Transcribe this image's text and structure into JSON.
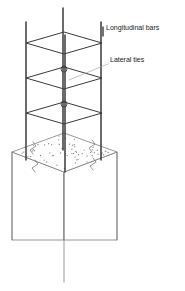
{
  "figure": {
    "kind": "isometric-engineering-detail",
    "background_color": "#ffffff",
    "line_color": "#6e6e6e",
    "bar_color": "#3a3a3a",
    "stipple_color": "#8a8a8a",
    "text_color": "#1a1a1a"
  },
  "annotations": [
    {
      "id": "longitudinal-bars",
      "label": "Longitudinal bars",
      "text_x": 106,
      "text_y": 30,
      "leader": {
        "x1": 103,
        "y1": 27,
        "x2": 103,
        "y2": 36,
        "style": "tick"
      }
    },
    {
      "id": "lateral-ties",
      "label": "Lateral ties",
      "text_x": 110,
      "text_y": 62,
      "leader": {
        "x1": 108,
        "y1": 64,
        "x2": 69,
        "y2": 80,
        "style": "line"
      }
    }
  ],
  "cage": {
    "description": "Square tie cage drawn in isometric: each lateral tie reads as a rhombus; four longitudinal bars at the rhombus corners.",
    "tie_count": 3,
    "tie_levels_y": [
      43,
      78,
      113
    ],
    "rhombus": {
      "half_width": 38,
      "half_height": 11,
      "center_x": 64
    },
    "ties": [
      {
        "index": 1,
        "center_y": 43,
        "label": "lateral-tie-top"
      },
      {
        "index": 2,
        "center_y": 78,
        "label": "lateral-tie-middle"
      },
      {
        "index": 3,
        "center_y": 113,
        "label": "lateral-tie-bottom"
      }
    ],
    "bars": [
      {
        "id": "bar-left",
        "x": 26,
        "y_top": 22,
        "y_bottom": 160,
        "role": "corner"
      },
      {
        "id": "bar-rear-center",
        "x": 63,
        "y_top": 8,
        "y_bottom": 150,
        "role": "corner-rear"
      },
      {
        "id": "bar-front-center",
        "x": 65,
        "y_top": 35,
        "y_bottom": 172,
        "role": "corner-front"
      },
      {
        "id": "bar-right",
        "x": 101,
        "y_top": 22,
        "y_bottom": 160,
        "role": "corner"
      }
    ],
    "tie_hooks": [
      {
        "x": 64,
        "y": 69,
        "r": 3
      },
      {
        "x": 64,
        "y": 104,
        "r": 3
      }
    ]
  },
  "concrete_block": {
    "description": "Column below shown cut: stippled isometric top face with break-line symbols, prism body continuing downward.",
    "top_face": {
      "top_vertex": {
        "x": 64,
        "y": 133
      },
      "right_vertex": {
        "x": 117,
        "y": 152
      },
      "bottom_vertex": {
        "x": 64,
        "y": 172
      },
      "left_vertex": {
        "x": 12,
        "y": 152
      }
    },
    "body": {
      "left_edge": {
        "x": 12,
        "y_top": 152,
        "y_bottom": 240
      },
      "right_edge": {
        "x": 117,
        "y_top": 152,
        "y_bottom": 240
      },
      "center_edge": {
        "x": 64,
        "y_top": 172,
        "y_bottom": 282
      }
    },
    "break_lines": [
      {
        "id": "break-left",
        "x": 33,
        "y": 148
      },
      {
        "id": "break-right",
        "x": 92,
        "y": 146
      },
      {
        "id": "break-front-left",
        "x": 35,
        "y": 166
      },
      {
        "id": "break-front-right",
        "x": 93,
        "y": 164
      }
    ],
    "stipple": {
      "dot_count": 150,
      "dot_radius": 0.65,
      "seed": 7
    }
  }
}
